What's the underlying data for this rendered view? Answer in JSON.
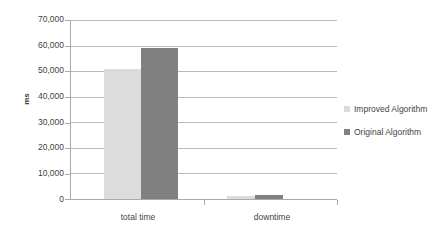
{
  "chart_data": {
    "type": "bar",
    "title": "",
    "subtitle": "",
    "xlabel": "",
    "ylabel": "ms",
    "categories": [
      "total time",
      "downtime"
    ],
    "series": [
      {
        "name": "Improved Algorithm",
        "color": "#dcdcdc",
        "values": [
          51000,
          1000
        ]
      },
      {
        "name": "Original Algorithm",
        "color": "#808080",
        "values": [
          59000,
          1500
        ]
      }
    ],
    "ylim": [
      0,
      70000
    ],
    "ytick_step": 10000,
    "ytick_labels": [
      "70,000",
      "60,000",
      "50,000",
      "40,000",
      "30,000",
      "20,000",
      "10,000",
      "0"
    ],
    "ytick_values": [
      70000,
      60000,
      50000,
      40000,
      30000,
      20000,
      10000,
      0
    ],
    "grid": true,
    "grid_axis": "y",
    "legend_position": "right",
    "legend": [
      {
        "label": "Improved Algorithm",
        "color": "#dcdcdc"
      },
      {
        "label": "Original Algorithm",
        "color": "#808080"
      }
    ]
  },
  "colors": {
    "background": "#ffffff",
    "gridline": "#b9b9b9",
    "axis": "#a9a9a9",
    "text": "#3f3f3f",
    "series_light": "#dcdcdc",
    "series_dark": "#808080"
  }
}
